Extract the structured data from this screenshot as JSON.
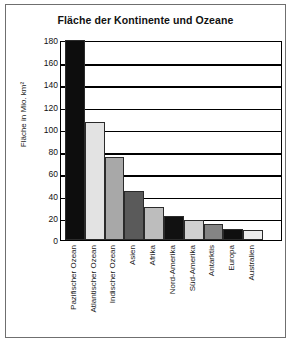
{
  "chart_data": {
    "type": "bar",
    "title": "Fläche der Kontinente und Ozeane",
    "xlabel": "",
    "ylabel": "Fläche in Mio. km²",
    "ylim": [
      0,
      180
    ],
    "yticks": [
      0,
      20,
      40,
      60,
      80,
      100,
      120,
      140,
      160,
      180
    ],
    "grid": true,
    "legend": "none",
    "categories": [
      "Pazifischer Ozean",
      "Atlantischer Ozean",
      "Indischer Ozean",
      "Asien",
      "Afrika",
      "Nord-Amerika",
      "Süd-Amerika",
      "Antarktis",
      "Europa",
      "Australien"
    ],
    "values": [
      180,
      106,
      75,
      44,
      30,
      22,
      18,
      14,
      10,
      9
    ],
    "bar_colors": [
      "#0d0d0d",
      "#e3e3e3",
      "#a8a8a8",
      "#5a5a5a",
      "#bdbdbd",
      "#111111",
      "#d0d0d0",
      "#848484",
      "#0f0f0f",
      "#ededed"
    ]
  }
}
